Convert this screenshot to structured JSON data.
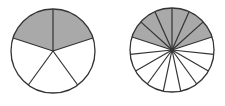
{
  "diagram": {
    "type": "fraction-circles",
    "background": "#ffffff",
    "shade_color": "#a9a9a9",
    "line_color": "#333333",
    "circles": [
      {
        "name": "circle-fifths",
        "cx": 53,
        "cy": 51,
        "r": 42,
        "slices": 5,
        "shaded": 2,
        "fraction": "2/5",
        "start_angle_deg": -90
      },
      {
        "name": "circle-fifteenths",
        "cx": 172,
        "cy": 50,
        "r": 42,
        "slices": 15,
        "shaded": 6,
        "fraction": "6/15",
        "start_angle_deg": -90
      }
    ]
  }
}
